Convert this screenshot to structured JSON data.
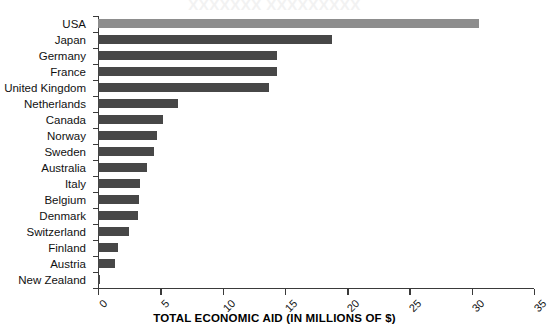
{
  "ghost_title": "XXXXXXX XXXXXXXXX",
  "chart_data": {
    "type": "bar",
    "orientation": "horizontal",
    "title": "",
    "xlabel": "TOTAL ECONOMIC AID (IN MILLIONS OF $)",
    "ylabel": "",
    "xlim": [
      0,
      35
    ],
    "xticks": [
      0,
      5,
      10,
      15,
      20,
      25,
      30,
      35
    ],
    "xtick_labels": [
      "0",
      "5",
      "10",
      "15",
      "20",
      "25",
      "30",
      "35"
    ],
    "grid": false,
    "legend": null,
    "categories": [
      "USA",
      "Japan",
      "Germany",
      "France",
      "United Kingdom",
      "Netherlands",
      "Canada",
      "Norway",
      "Sweden",
      "Australia",
      "Italy",
      "Belgium",
      "Denmark",
      "Switzerland",
      "Finland",
      "Austria",
      "New Zealand"
    ],
    "values": [
      30.6,
      18.8,
      14.4,
      14.4,
      13.7,
      6.4,
      5.2,
      4.7,
      4.5,
      3.9,
      3.4,
      3.3,
      3.2,
      2.5,
      1.6,
      1.4,
      0.2
    ],
    "bar_colors": [
      "#8d8d8d",
      "#474747",
      "#474747",
      "#474747",
      "#474747",
      "#474747",
      "#474747",
      "#474747",
      "#474747",
      "#474747",
      "#474747",
      "#474747",
      "#474747",
      "#474747",
      "#474747",
      "#474747",
      "#474747"
    ],
    "highlight_category": "USA",
    "axis_color": "#3a3a3a"
  }
}
